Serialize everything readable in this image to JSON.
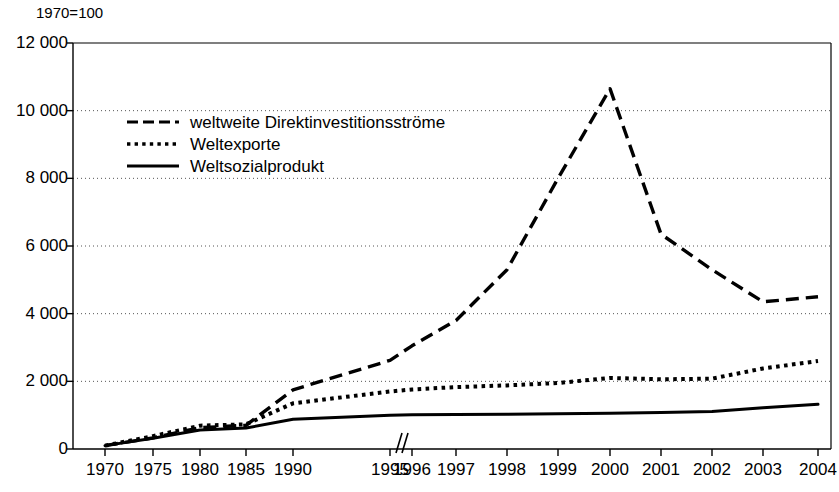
{
  "chart_data": {
    "type": "line",
    "title": "",
    "note": "1970=100",
    "xlabel": "",
    "ylabel": "",
    "ylim": [
      0,
      12000
    ],
    "ytick_labels": [
      "12 000",
      "10 000",
      "8 000",
      "6 000",
      "4 000",
      "2 000",
      "0"
    ],
    "ytick_values": [
      12000,
      10000,
      8000,
      6000,
      4000,
      2000,
      0
    ],
    "grid": "horizontal-dotted",
    "axis_break": {
      "between": [
        "1995",
        "1996"
      ],
      "symbol": "//"
    },
    "legend_position": "upper-left-inside",
    "categories": [
      "1970",
      "1975",
      "1980",
      "1985",
      "1990",
      "1995",
      "1996",
      "1997",
      "1998",
      "1999",
      "2000",
      "2001",
      "2002",
      "2003",
      "2004"
    ],
    "series": [
      {
        "name": "weltweite Direktinvestitionsströme",
        "style": "dashed",
        "color": "#000000",
        "values": [
          100,
          330,
          630,
          700,
          1750,
          2620,
          3050,
          3800,
          5300,
          8000,
          10650,
          6350,
          5300,
          4350,
          4500
        ]
      },
      {
        "name": "Weltexporte",
        "style": "dotted",
        "color": "#000000",
        "values": [
          100,
          380,
          690,
          730,
          1350,
          1700,
          1760,
          1830,
          1880,
          1950,
          2100,
          2060,
          2080,
          2380,
          2600
        ]
      },
      {
        "name": "Weltsozialprodukt",
        "style": "solid",
        "color": "#000000",
        "values": [
          100,
          320,
          560,
          620,
          880,
          1000,
          1010,
          1020,
          1030,
          1040,
          1060,
          1080,
          1110,
          1220,
          1320
        ]
      }
    ]
  },
  "legend": {
    "items": [
      {
        "label": "weltweite Direktinvestitionsströme",
        "key": "dashed-line-key"
      },
      {
        "label": "Weltexporte",
        "key": "dotted-line-key"
      },
      {
        "label": "Weltsozialprodukt",
        "key": "solid-line-key"
      }
    ]
  }
}
